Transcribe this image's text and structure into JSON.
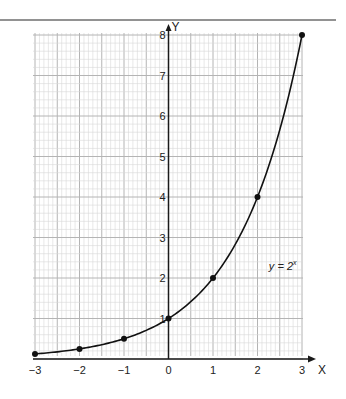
{
  "chart_data": {
    "type": "line",
    "title": "",
    "xlabel": "X",
    "ylabel": "Y",
    "xlim": [
      -3,
      3
    ],
    "ylim": [
      0,
      8
    ],
    "grid": true,
    "legend": null,
    "x_ticks": [
      "-3",
      "-2",
      "-1",
      "0",
      "1",
      "2",
      "3"
    ],
    "y_ticks": [
      "1",
      "2",
      "3",
      "4",
      "5",
      "6",
      "7",
      "8"
    ],
    "annotation": {
      "text_base": "y = 2",
      "text_exp": "x",
      "x": 2.3,
      "y": 2.3
    },
    "series": [
      {
        "name": "y = 2^x",
        "x": [
          -3,
          -2,
          -1,
          0,
          1,
          2,
          3
        ],
        "y": [
          0.125,
          0.25,
          0.5,
          1,
          2,
          4,
          8
        ],
        "markers": true
      }
    ]
  },
  "colors": {
    "grid_minor": "#d6d6d6",
    "grid_major": "#b4b4b4",
    "axis": "#1a1a1a",
    "curve": "#111111",
    "top_rule": "#6e6e6e"
  }
}
